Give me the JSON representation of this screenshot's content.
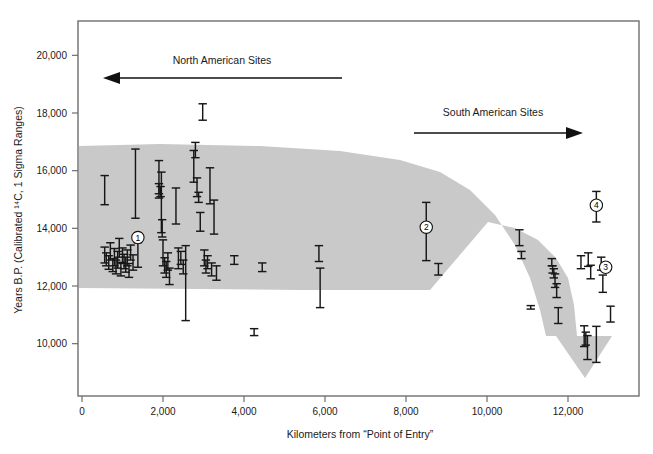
{
  "chart_data": {
    "type": "scatter",
    "title": "",
    "xlabel": "Kilometers from “Point of Entry”",
    "ylabel": "Years B.P. (Calibrated ¹⁴C, 1 Sigma Ranges)",
    "xlim": [
      0,
      13500
    ],
    "ylim": [
      8800,
      20700
    ],
    "xticks": [
      0,
      2000,
      4000,
      6000,
      8000,
      10000,
      12000
    ],
    "xticklabels": [
      "0",
      "2,000",
      "4,000",
      "6,000",
      "8,000",
      "10,000",
      "12,000"
    ],
    "yticks": [
      10000,
      12000,
      14000,
      16000,
      18000,
      20000
    ],
    "yticklabels": [
      "10,000",
      "12,000",
      "14,000",
      "16,000",
      "18,000",
      "20,000"
    ],
    "grid": false,
    "legend": "none",
    "series_name": "Radiocarbon dated archaeological sites",
    "errorbar_style": "vertical line with end caps, 1 sigma calibrated range",
    "points": [
      {
        "x": 560,
        "ylow": 14820,
        "yhigh": 15830
      },
      {
        "x": 560,
        "ylow": 12800,
        "yhigh": 13350
      },
      {
        "x": 600,
        "ylow": 12700,
        "yhigh": 13150
      },
      {
        "x": 660,
        "ylow": 12580,
        "yhigh": 13050
      },
      {
        "x": 700,
        "ylow": 12900,
        "yhigh": 13500
      },
      {
        "x": 760,
        "ylow": 12500,
        "yhigh": 12950
      },
      {
        "x": 800,
        "ylow": 12700,
        "yhigh": 13300
      },
      {
        "x": 840,
        "ylow": 12420,
        "yhigh": 12900
      },
      {
        "x": 880,
        "ylow": 12620,
        "yhigh": 13200
      },
      {
        "x": 920,
        "ylow": 13000,
        "yhigh": 13650
      },
      {
        "x": 960,
        "ylow": 12350,
        "yhigh": 12820
      },
      {
        "x": 1000,
        "ylow": 12780,
        "yhigh": 13320
      },
      {
        "x": 1040,
        "ylow": 12600,
        "yhigh": 13100
      },
      {
        "x": 1080,
        "ylow": 12480,
        "yhigh": 13000
      },
      {
        "x": 1120,
        "ylow": 12700,
        "yhigh": 13250
      },
      {
        "x": 1160,
        "ylow": 12300,
        "yhigh": 12780
      },
      {
        "x": 1200,
        "ylow": 12900,
        "yhigh": 13420
      },
      {
        "x": 1260,
        "ylow": 12550,
        "yhigh": 13080
      },
      {
        "x": 1320,
        "ylow": 14350,
        "yhigh": 16750
      },
      {
        "x": 1380,
        "ylow": 12650,
        "yhigh": 13500
      },
      {
        "x": 1900,
        "ylow": 15050,
        "yhigh": 16350
      },
      {
        "x": 1900,
        "ylow": 15200,
        "yhigh": 15550
      },
      {
        "x": 1940,
        "ylow": 15100,
        "yhigh": 15450
      },
      {
        "x": 1960,
        "ylow": 13850,
        "yhigh": 15950
      },
      {
        "x": 1980,
        "ylow": 13700,
        "yhigh": 14300
      },
      {
        "x": 2000,
        "ylow": 12700,
        "yhigh": 13600
      },
      {
        "x": 2040,
        "ylow": 12450,
        "yhigh": 12980
      },
      {
        "x": 2080,
        "ylow": 12300,
        "yhigh": 12850
      },
      {
        "x": 2120,
        "ylow": 12550,
        "yhigh": 13150
      },
      {
        "x": 2160,
        "ylow": 12050,
        "yhigh": 12620
      },
      {
        "x": 2320,
        "ylow": 14150,
        "yhigh": 15400
      },
      {
        "x": 2380,
        "ylow": 12600,
        "yhigh": 13320
      },
      {
        "x": 2440,
        "ylow": 12750,
        "yhigh": 13200
      },
      {
        "x": 2500,
        "ylow": 12420,
        "yhigh": 12900
      },
      {
        "x": 2560,
        "ylow": 10800,
        "yhigh": 13400
      },
      {
        "x": 2760,
        "ylow": 15600,
        "yhigh": 16700
      },
      {
        "x": 2800,
        "ylow": 16450,
        "yhigh": 16980
      },
      {
        "x": 2840,
        "ylow": 15100,
        "yhigh": 15750
      },
      {
        "x": 2880,
        "ylow": 14900,
        "yhigh": 15250
      },
      {
        "x": 2920,
        "ylow": 13900,
        "yhigh": 14550
      },
      {
        "x": 2980,
        "ylow": 17750,
        "yhigh": 18320
      },
      {
        "x": 3020,
        "ylow": 12700,
        "yhigh": 13250
      },
      {
        "x": 3060,
        "ylow": 12450,
        "yhigh": 12900
      },
      {
        "x": 3100,
        "ylow": 12600,
        "yhigh": 13050
      },
      {
        "x": 3160,
        "ylow": 14850,
        "yhigh": 16100
      },
      {
        "x": 3200,
        "ylow": 12350,
        "yhigh": 12800
      },
      {
        "x": 3260,
        "ylow": 13800,
        "yhigh": 14980
      },
      {
        "x": 3320,
        "ylow": 12200,
        "yhigh": 12700
      },
      {
        "x": 3760,
        "ylow": 12750,
        "yhigh": 13050
      },
      {
        "x": 4250,
        "ylow": 10280,
        "yhigh": 10520
      },
      {
        "x": 4450,
        "ylow": 12500,
        "yhigh": 12800
      },
      {
        "x": 5850,
        "ylow": 12850,
        "yhigh": 13400
      },
      {
        "x": 5880,
        "ylow": 11250,
        "yhigh": 12620
      },
      {
        "x": 8500,
        "ylow": 12880,
        "yhigh": 14900
      },
      {
        "x": 8800,
        "ylow": 12380,
        "yhigh": 12780
      },
      {
        "x": 10800,
        "ylow": 13400,
        "yhigh": 13950
      },
      {
        "x": 10850,
        "ylow": 12950,
        "yhigh": 13200
      },
      {
        "x": 11080,
        "ylow": 11200,
        "yhigh": 11320
      },
      {
        "x": 11600,
        "ylow": 12700,
        "yhigh": 12950
      },
      {
        "x": 11620,
        "ylow": 12450,
        "yhigh": 12700
      },
      {
        "x": 11650,
        "ylow": 12280,
        "yhigh": 12600
      },
      {
        "x": 11680,
        "ylow": 11950,
        "yhigh": 12420
      },
      {
        "x": 11720,
        "ylow": 11600,
        "yhigh": 12080
      },
      {
        "x": 11760,
        "ylow": 10700,
        "yhigh": 11250
      },
      {
        "x": 12320,
        "ylow": 12600,
        "yhigh": 13050
      },
      {
        "x": 12500,
        "ylow": 12680,
        "yhigh": 13150
      },
      {
        "x": 12560,
        "ylow": 12250,
        "yhigh": 12720
      },
      {
        "x": 12700,
        "ylow": 14220,
        "yhigh": 15280
      },
      {
        "x": 12820,
        "ylow": 12550,
        "yhigh": 13000
      },
      {
        "x": 12860,
        "ylow": 11780,
        "yhigh": 12380
      },
      {
        "x": 12400,
        "ylow": 9900,
        "yhigh": 10620
      },
      {
        "x": 12440,
        "ylow": 9950,
        "yhigh": 10400
      },
      {
        "x": 12480,
        "ylow": 9450,
        "yhigh": 10280
      },
      {
        "x": 12700,
        "ylow": 9350,
        "yhigh": 10600
      },
      {
        "x": 13050,
        "ylow": 10750,
        "yhigh": 11300
      }
    ],
    "band": {
      "label": "shaded dispersal corridor band terminating in downward arrowhead",
      "color": "#c9c9c9"
    },
    "annotations": [
      {
        "name": "north-american-sites",
        "text": "North American Sites",
        "arrow_direction": "left"
      },
      {
        "name": "south-american-sites",
        "text": "South American Sites",
        "arrow_direction": "right"
      }
    ],
    "numbered_markers": [
      {
        "id": "1",
        "label": "①",
        "x": 1380,
        "y": 13680
      },
      {
        "id": "2",
        "label": "②",
        "x": 8500,
        "y": 14040
      },
      {
        "id": "3",
        "label": "③",
        "x": 12930,
        "y": 12650
      },
      {
        "id": "4",
        "label": "④",
        "x": 12700,
        "y": 14800
      }
    ]
  },
  "colors": {
    "frame": "#6e6e6e",
    "band": "#c9c9c9",
    "data": "#171717",
    "text": "#1a1a1a",
    "background": "#ffffff"
  }
}
